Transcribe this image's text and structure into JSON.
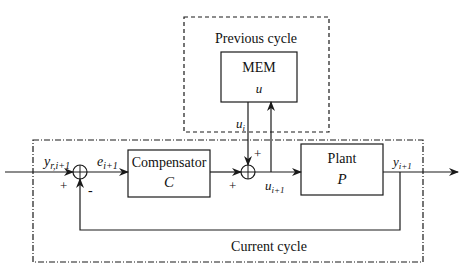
{
  "diagram": {
    "type": "block-diagram",
    "regions": {
      "previous_cycle": {
        "label": "Previous cycle"
      },
      "current_cycle": {
        "label": "Current cycle"
      }
    },
    "blocks": {
      "memory": {
        "name": "MEM",
        "symbol": "u"
      },
      "compensator": {
        "name": "Compensator",
        "symbol": "C"
      },
      "plant": {
        "name": "Plant",
        "symbol": "P"
      }
    },
    "signals": {
      "reference": {
        "base": "y",
        "sub": "r,i+1"
      },
      "error": {
        "base": "e",
        "sub": "i+1"
      },
      "prev_input": {
        "base": "u",
        "sub": "i"
      },
      "input": {
        "base": "u",
        "sub": "i+1"
      },
      "output": {
        "base": "y",
        "sub": "i+1"
      }
    },
    "signs": {
      "sum1_plus": "+",
      "sum1_minus": "-",
      "sum2_left_plus": "+",
      "sum2_top_plus": "+"
    },
    "colors": {
      "line": "#1a1a1a",
      "background": "#ffffff"
    }
  }
}
